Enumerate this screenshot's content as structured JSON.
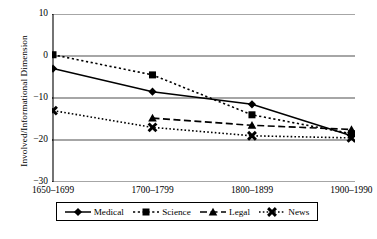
{
  "chart_data": {
    "type": "line",
    "title": "",
    "xlabel": "",
    "ylabel": "Involved/Informational Dimension",
    "categories": [
      "1650–1699",
      "1700–1799",
      "1800–1899",
      "1900–1990"
    ],
    "ylim": [
      -30,
      10
    ],
    "yticks": [
      10,
      0,
      -10,
      -20,
      -30
    ],
    "ytick_labels": [
      "10",
      "0",
      "−10",
      "−20",
      "−30"
    ],
    "grid": "horizontal",
    "legend_position": "bottom",
    "series": [
      {
        "name": "Medical",
        "marker": "diamond",
        "line_style": "solid",
        "color": "#000000",
        "values": [
          -3.0,
          -8.5,
          -11.5,
          -19.0
        ]
      },
      {
        "name": "Science",
        "marker": "square",
        "line_style": "dotted",
        "color": "#000000",
        "values": [
          0.3,
          -4.5,
          -14.0,
          -18.5
        ]
      },
      {
        "name": "Legal",
        "marker": "triangle",
        "line_style": "dashed",
        "color": "#000000",
        "values": [
          null,
          -14.8,
          -16.5,
          -17.5
        ]
      },
      {
        "name": "News",
        "marker": "x",
        "line_style": "fine-dotted",
        "color": "#000000",
        "values": [
          -13.0,
          -17.0,
          -19.0,
          -19.5
        ]
      }
    ]
  },
  "axis": {
    "y_title": "Involved/Informational Dimension"
  },
  "legend": {
    "items": [
      {
        "label": "Medical"
      },
      {
        "label": "Science"
      },
      {
        "label": "Legal"
      },
      {
        "label": "News"
      }
    ]
  }
}
